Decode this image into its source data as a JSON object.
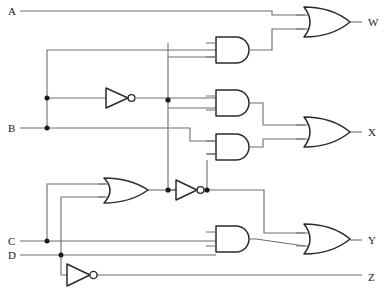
{
  "figure": {
    "kind": "logic-circuit-diagram",
    "caption": "",
    "background_color": "#ffffff",
    "wire_color": "#6e6e6e",
    "gate_outline_color": "#2b2b2b",
    "junction_color": "#1a1a1a"
  },
  "inputs": [
    {
      "id": "A",
      "label": "A",
      "x": 8,
      "y": 11
    },
    {
      "id": "B",
      "label": "B",
      "x": 8,
      "y": 128
    },
    {
      "id": "C",
      "label": "C",
      "x": 8,
      "y": 241
    },
    {
      "id": "D",
      "label": "D",
      "x": 8,
      "y": 255
    }
  ],
  "outputs": [
    {
      "id": "W",
      "label": "W",
      "x": 368,
      "y": 22
    },
    {
      "id": "X",
      "label": "X",
      "x": 368,
      "y": 132
    },
    {
      "id": "Y",
      "label": "Y",
      "x": 368,
      "y": 240
    },
    {
      "id": "Z",
      "label": "Z",
      "x": 368,
      "y": 277
    }
  ],
  "gates": [
    {
      "id": "and1",
      "type": "AND",
      "x": 216,
      "y": 37,
      "w": 40,
      "h": 26
    },
    {
      "id": "and2",
      "type": "AND",
      "x": 216,
      "y": 90,
      "w": 40,
      "h": 26
    },
    {
      "id": "and3",
      "type": "AND",
      "x": 216,
      "y": 134,
      "w": 40,
      "h": 26
    },
    {
      "id": "and4",
      "type": "AND",
      "x": 216,
      "y": 226,
      "w": 40,
      "h": 26
    },
    {
      "id": "or_w",
      "type": "OR",
      "x": 304,
      "y": 7,
      "w": 46,
      "h": 30
    },
    {
      "id": "or_x",
      "type": "OR",
      "x": 304,
      "y": 117,
      "w": 46,
      "h": 30
    },
    {
      "id": "or_y",
      "type": "OR",
      "x": 304,
      "y": 224,
      "w": 46,
      "h": 30
    },
    {
      "id": "or_cd",
      "type": "OR",
      "x": 104,
      "y": 178,
      "w": 44,
      "h": 28
    },
    {
      "id": "inv_b",
      "type": "NOT",
      "x": 106,
      "y": 88,
      "w": 24,
      "h": 20
    },
    {
      "id": "inv_mid",
      "type": "NOT",
      "x": 175,
      "y": 180,
      "w": 24,
      "h": 20
    },
    {
      "id": "inv_d",
      "type": "NOT",
      "x": 66,
      "y": 264,
      "w": 26,
      "h": 21
    }
  ],
  "junctions": [
    {
      "id": "j-b-branch-hi",
      "x": 47,
      "y": 98
    },
    {
      "id": "j-b-branch-lo",
      "x": 47,
      "y": 128
    },
    {
      "id": "j-invb-out",
      "x": 168,
      "y": 100
    },
    {
      "id": "j-invmid-in",
      "x": 168,
      "y": 190
    },
    {
      "id": "j-invmid-out",
      "x": 207,
      "y": 190
    },
    {
      "id": "j-c-branch",
      "x": 47,
      "y": 241
    },
    {
      "id": "j-d-branch",
      "x": 61,
      "y": 255
    }
  ],
  "nets": {
    "A_to_or_w": "A routed across the top into the upper input of the W OR gate",
    "B_to_inverter": "B branches upward into the NOT gate and into AND gates",
    "notB_fanout": "Inverted B feeds the AND gates and the mid NOT gate column",
    "CD_to_or": "C and D branch up into the lower OR gate",
    "or_cd_to_inv": "Lower OR output feeds the mid NOT gate",
    "notD_to_Z": "D inverted drives output Z directly"
  }
}
